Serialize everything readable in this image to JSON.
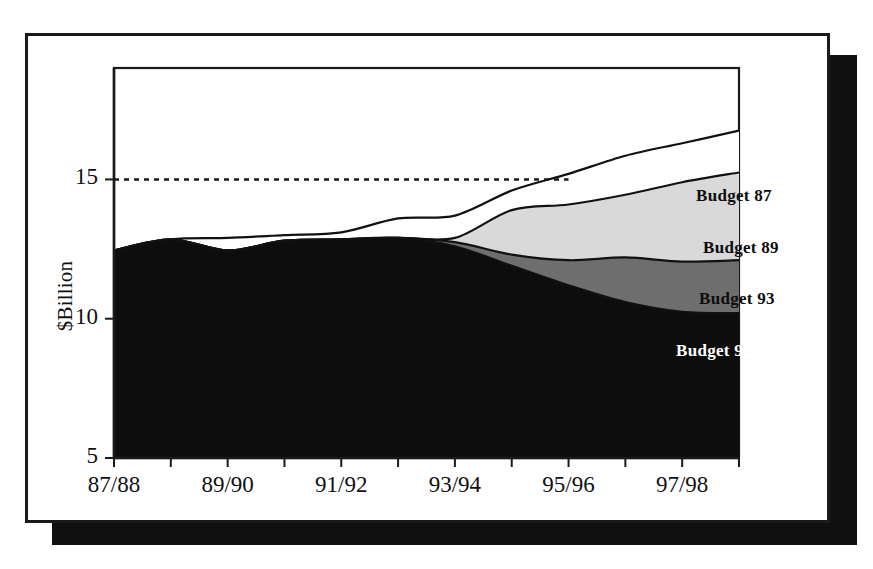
{
  "figure": {
    "name": "stacked-area-budget-projection",
    "y_axis_title": "$Billion"
  },
  "chart_data": {
    "type": "area",
    "title": "",
    "xlabel": "",
    "ylabel": "$Billion",
    "stacked": true,
    "grid": false,
    "legend_position": "inline-right",
    "ylim": [
      5,
      19
    ],
    "ytick_values": [
      5,
      10,
      15
    ],
    "ytick_labels": [
      "5",
      "10",
      "15"
    ],
    "x": [
      "87/88",
      "88/89",
      "89/90",
      "90/91",
      "91/92",
      "92/93",
      "93/94",
      "94/95",
      "95/96",
      "96/97",
      "97/98",
      "98/99"
    ],
    "xtick_labels": [
      "87/88",
      "89/90",
      "91/92",
      "93/94",
      "95/96",
      "97/98"
    ],
    "xtick_label_indices": [
      0,
      2,
      4,
      6,
      8,
      10
    ],
    "reference_line": {
      "label": "15",
      "value": 15,
      "style": "dashed",
      "x_start": "87/88",
      "x_end": "95/96"
    },
    "series": [
      {
        "name": "Budget 94",
        "label": "Budget 94",
        "fill": "#0d0d0d",
        "text_color": "#ffffff",
        "cumulative_values": [
          12.45,
          12.85,
          12.45,
          12.8,
          12.85,
          12.9,
          12.6,
          11.9,
          11.2,
          10.6,
          10.25,
          10.2
        ]
      },
      {
        "name": "Budget 93",
        "label": "Budget 93",
        "fill": "#6e6e6e",
        "text_color": "#0d0d0d",
        "cumulative_values": [
          12.45,
          12.85,
          12.45,
          12.8,
          12.85,
          12.9,
          12.75,
          12.3,
          12.1,
          12.2,
          12.05,
          12.1
        ]
      },
      {
        "name": "Budget 89",
        "label": "Budget 89",
        "fill": "#d9d9d9",
        "text_color": "#0d0d0d",
        "cumulative_values": [
          12.45,
          12.85,
          12.45,
          12.8,
          12.85,
          12.9,
          12.9,
          13.9,
          14.1,
          14.45,
          14.9,
          15.25
        ]
      },
      {
        "name": "Budget 87",
        "label": "Budget 87",
        "fill": "#ffffff",
        "text_color": "#0d0d0d",
        "cumulative_values": [
          12.45,
          12.85,
          12.9,
          13.0,
          13.1,
          13.6,
          13.7,
          14.6,
          15.2,
          15.85,
          16.3,
          16.75
        ]
      }
    ],
    "annotations": [
      {
        "text": "Budget 87",
        "x_px": 693,
        "y_px": 186,
        "color": "#0d0d0d"
      },
      {
        "text": "Budget 89",
        "x_px": 700,
        "y_px": 238,
        "color": "#0d0d0d"
      },
      {
        "text": "Budget 93",
        "x_px": 696,
        "y_px": 289,
        "color": "#0d0d0d"
      },
      {
        "text": "Budget 94",
        "x_px": 673,
        "y_px": 341,
        "color": "#ffffff"
      }
    ]
  }
}
